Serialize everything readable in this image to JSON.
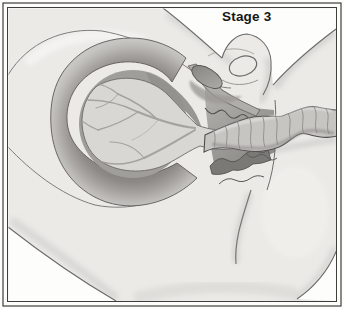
{
  "figure": {
    "stage_label": "Stage 3",
    "colors": {
      "background": "#fdfdfb",
      "frame": "#403e3c",
      "skin": "#ebeae7",
      "outline": "#6b6a68",
      "uterine_wall": "#b5b3b0",
      "uterine_wall_inner": "#868482",
      "cavity": "#a09e9b",
      "cavity_shadow": "#93918e",
      "placenta": "#d8d7d4",
      "vessels": "#a5a3a0",
      "canal_dark": "#7b7976",
      "cord": "#c7c5c2",
      "label_text": "#171715"
    }
  }
}
